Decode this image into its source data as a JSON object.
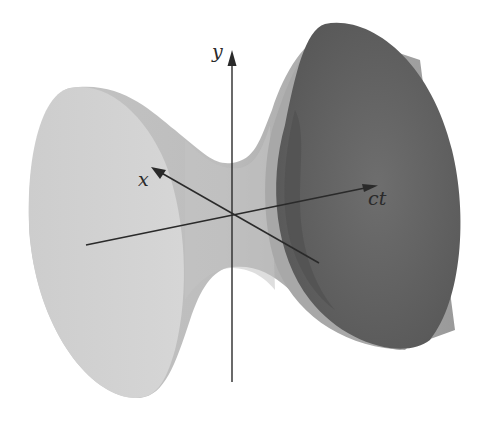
{
  "figure": {
    "axes": {
      "y": {
        "label": "y"
      },
      "x": {
        "label": "x"
      },
      "ct": {
        "label": "ct"
      }
    },
    "colors": {
      "background": "#ffffff",
      "surface_light": "#c9c9c9",
      "surface_mid": "#b3b3b3",
      "surface_dark": "#6a6a6a",
      "cap_dark": "#5c5c5c",
      "axis": "#2a2a2a"
    }
  }
}
